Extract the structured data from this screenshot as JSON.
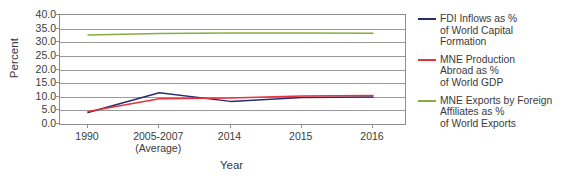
{
  "chart_data": {
    "type": "line",
    "title": "",
    "xlabel": "Year",
    "ylabel": "Percent",
    "categories": [
      "1990",
      "2005-2007\n(Average)",
      "2014",
      "2015",
      "2016"
    ],
    "category_labels": [
      {
        "main": "1990",
        "sub": ""
      },
      {
        "main": "2005-2007",
        "sub": "(Average)"
      },
      {
        "main": "2014",
        "sub": ""
      },
      {
        "main": "2015",
        "sub": ""
      },
      {
        "main": "2016",
        "sub": ""
      }
    ],
    "ylim": [
      0.0,
      40.0
    ],
    "ytick_labels": [
      "40.0",
      "35.0",
      "30.0",
      "25.0",
      "20.0",
      "15.0",
      "10.0",
      "5.0",
      "0.0"
    ],
    "ytick_values": [
      40.0,
      35.0,
      30.0,
      25.0,
      20.0,
      15.0,
      10.0,
      5.0,
      0.0
    ],
    "grid": true,
    "legend_position": "right",
    "series": [
      {
        "name": "FDI Inflows as %\nof World  Capital\nFormation",
        "color": "#2b2b6e",
        "values": [
          4.2,
          11.5,
          8.3,
          9.7,
          9.9
        ]
      },
      {
        "name": "MNE Production\nAbroad as %\nof World GDP",
        "color": "#e8323c",
        "values": [
          4.6,
          9.3,
          9.5,
          10.3,
          10.5
        ]
      },
      {
        "name": "MNE Exports by Foreign\nAffiliates as %\nof World Exports",
        "color": "#8aac3c",
        "values": [
          32.7,
          33.2,
          33.4,
          33.4,
          33.3
        ]
      }
    ]
  },
  "axis": {
    "y_title": "Percent",
    "x_title": "Year"
  }
}
